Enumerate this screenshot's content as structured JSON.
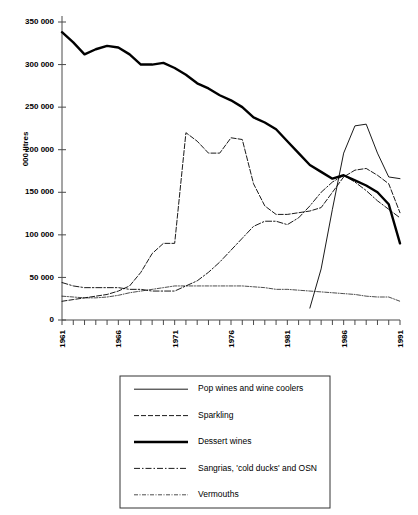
{
  "chart_data": {
    "type": "line",
    "title": "",
    "xlabel": "",
    "ylabel": "000 litres",
    "xlim": [
      1961,
      1991
    ],
    "ylim": [
      0,
      350000
    ],
    "grid": false,
    "legend_position": "below-plot",
    "y_ticks": [
      0,
      50000,
      100000,
      150000,
      200000,
      250000,
      300000,
      350000
    ],
    "y_tick_labels": [
      "0",
      "50 000",
      "100 000",
      "150 000",
      "200 000",
      "250 000",
      "300 000",
      "350 000"
    ],
    "x_ticks": [
      1961,
      1962,
      1963,
      1964,
      1965,
      1966,
      1967,
      1968,
      1969,
      1970,
      1971,
      1972,
      1973,
      1974,
      1975,
      1976,
      1977,
      1978,
      1979,
      1980,
      1981,
      1982,
      1983,
      1984,
      1985,
      1986,
      1987,
      1988,
      1989,
      1990,
      1991
    ],
    "x_tick_labels": [
      "1961",
      "1966",
      "1971",
      "1976",
      "1981",
      "1986",
      "1991"
    ],
    "x_labelled_ticks": [
      1961,
      1966,
      1971,
      1976,
      1981,
      1986,
      1991
    ],
    "x": [
      1961,
      1962,
      1963,
      1964,
      1965,
      1966,
      1967,
      1968,
      1969,
      1970,
      1971,
      1972,
      1973,
      1974,
      1975,
      1976,
      1977,
      1978,
      1979,
      1980,
      1981,
      1982,
      1983,
      1984,
      1985,
      1986,
      1987,
      1988,
      1989,
      1990,
      1991
    ],
    "series": [
      {
        "name": "Pop wines and wine coolers",
        "style": "solid-thin",
        "x": [
          1983,
          1984,
          1985,
          1986,
          1987,
          1988,
          1989,
          1990,
          1991
        ],
        "values": [
          14000,
          60000,
          130000,
          196000,
          228000,
          230000,
          196000,
          168000,
          166000
        ]
      },
      {
        "name": "Sparkling",
        "style": "dashed",
        "x": [
          1961,
          1962,
          1963,
          1964,
          1965,
          1966,
          1967,
          1968,
          1969,
          1970,
          1971,
          1972,
          1973,
          1974,
          1975,
          1976,
          1977,
          1978,
          1979,
          1980,
          1981,
          1982,
          1983,
          1984,
          1985,
          1986,
          1987,
          1988,
          1989,
          1990,
          1991
        ],
        "values": [
          22000,
          24000,
          26000,
          28000,
          30000,
          34000,
          40000,
          56000,
          78000,
          90000,
          90000,
          220000,
          210000,
          196000,
          196000,
          214000,
          212000,
          160000,
          134000,
          124000,
          124000,
          126000,
          128000,
          132000,
          150000,
          168000,
          176000,
          178000,
          170000,
          160000,
          126000
        ]
      },
      {
        "name": "Dessert wines",
        "style": "solid-thick",
        "x": [
          1961,
          1962,
          1963,
          1964,
          1965,
          1966,
          1967,
          1968,
          1969,
          1970,
          1971,
          1972,
          1973,
          1974,
          1975,
          1976,
          1977,
          1978,
          1979,
          1980,
          1981,
          1982,
          1983,
          1984,
          1985,
          1986,
          1987,
          1988,
          1989,
          1990,
          1991
        ],
        "values": [
          338000,
          326000,
          312000,
          318000,
          322000,
          320000,
          312000,
          300000,
          300000,
          302000,
          296000,
          288000,
          278000,
          272000,
          264000,
          258000,
          250000,
          238000,
          232000,
          224000,
          210000,
          196000,
          182000,
          174000,
          166000,
          170000,
          164000,
          158000,
          150000,
          136000,
          90000
        ]
      },
      {
        "name": "Sangrias, 'cold ducks' and OSN",
        "style": "dashdot",
        "x": [
          1961,
          1962,
          1963,
          1964,
          1965,
          1966,
          1967,
          1968,
          1969,
          1970,
          1971,
          1972,
          1973,
          1974,
          1975,
          1976,
          1977,
          1978,
          1979,
          1980,
          1981,
          1982,
          1983,
          1984,
          1985,
          1986,
          1987,
          1988,
          1989,
          1990,
          1991
        ],
        "values": [
          44000,
          40000,
          38000,
          38000,
          38000,
          38000,
          36000,
          36000,
          34000,
          34000,
          34000,
          40000,
          46000,
          56000,
          68000,
          82000,
          96000,
          110000,
          116000,
          116000,
          112000,
          120000,
          134000,
          150000,
          162000,
          170000,
          162000,
          152000,
          140000,
          130000,
          120000
        ]
      },
      {
        "name": "Vermouths",
        "style": "fine-dashdot",
        "x": [
          1961,
          1962,
          1963,
          1964,
          1965,
          1966,
          1967,
          1968,
          1969,
          1970,
          1971,
          1972,
          1973,
          1974,
          1975,
          1976,
          1977,
          1978,
          1979,
          1980,
          1981,
          1982,
          1983,
          1984,
          1985,
          1986,
          1987,
          1988,
          1989,
          1990,
          1991
        ],
        "values": [
          28000,
          27000,
          26000,
          26000,
          27000,
          29000,
          32000,
          34000,
          36000,
          38000,
          40000,
          40000,
          40000,
          40000,
          40000,
          40000,
          40000,
          39000,
          38000,
          36000,
          36000,
          35000,
          34000,
          33000,
          32000,
          31000,
          30000,
          28000,
          27000,
          27000,
          22000
        ]
      }
    ]
  },
  "legend": {
    "items": [
      {
        "label": "Pop wines and wine coolers",
        "style": "solid-thin"
      },
      {
        "label": "Sparkling",
        "style": "dashed"
      },
      {
        "label": "Dessert wines",
        "style": "solid-thick"
      },
      {
        "label": "Sangrias, 'cold ducks' and OSN",
        "style": "dashdot"
      },
      {
        "label": "Vermouths",
        "style": "fine-dashdot"
      }
    ]
  },
  "colors": {
    "line": "#000000",
    "axis": "#4a4a4a",
    "legend_border": "#333333",
    "background": "#ffffff"
  }
}
